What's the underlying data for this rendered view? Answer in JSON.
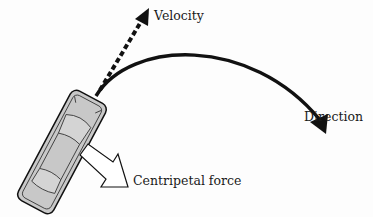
{
  "diagram": {
    "labels": {
      "velocity": "Velocity",
      "direction": "Direction",
      "centripetal": "Centripetal force"
    },
    "colors": {
      "car_fill": "#c8c8c8",
      "stroke": "#111111",
      "arrow_fill": "#ffffff",
      "background": "#fdfdfd"
    }
  }
}
